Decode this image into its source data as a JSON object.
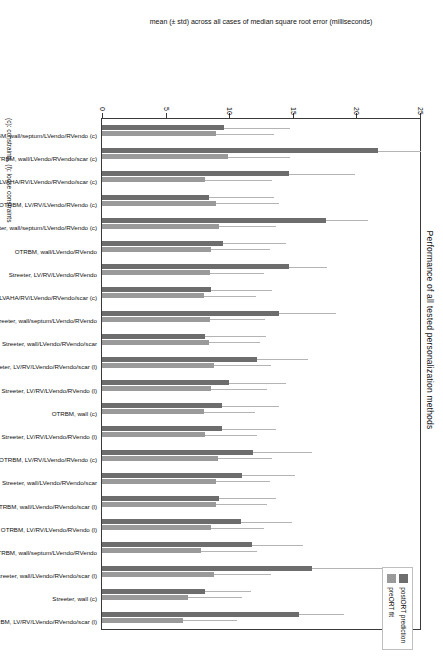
{
  "chart_data": {
    "type": "bar",
    "orientation": "vertical-rotated",
    "title": "Performance of all tested personalization methods",
    "xlabel": "",
    "ylabel": "mean (± std) across all cases of median square root error (milliseconds)",
    "ylim": [
      0,
      25
    ],
    "yticks": [
      0,
      5,
      10,
      15,
      20,
      25
    ],
    "grid": false,
    "legend_position": "top-right",
    "footnote": "(c): constraints, (l): loose constraints",
    "categories": [
      "OTRBM, wall/septum/LVendo/RVendo (c)",
      "OTRBM, wall/LVendo/RVendo/scar (c)",
      "OTRBM, LVAHA/RV/LVendo/RVendo/scar (c)",
      "OTRBM, LV/RV/LVendo/RVendo (c)",
      "Streeter, wall/septum/LVendo/RVendo (c)",
      "OTRBM, wall/LVendo/RVendo",
      "Streeter, LV/RV/LVendo/RVendo",
      "Streeter, LVAHA/RV/LVendo/RVendo/scar (c)",
      "Streeter, wall/septum/LVendo/RVendo",
      "Streeter, wall/LVendo/RVendo/scar",
      "Streeter, LV/RV/LVendo/RVendo/scar (l)",
      "Streeter, LV/RV/LVendo/RVendo (l)",
      "OTRBM, wall (c)",
      "Streeter, LV/RV/LVendo/RVendo (l)",
      "OTRBM, LV/RV/LVendo/RVendo (c)",
      "Streeter, wall/LVendo/RVendo/scar",
      "OTRBM, wall/LVendo/RVendo/scar (l)",
      "OTRBM, LV/RV/LVendo/RVendo (l)",
      "OTRBM, wall/septum/LVendo/RVendo",
      "Streeter, wall/LVendo/RVendo/scar (l)",
      "Streeter, wall (c)",
      "OTRBM, LV/RV/LVendo/RVendo/scar (l)"
    ],
    "series": [
      {
        "name": "postORT prediction",
        "color": "#6d6d6d",
        "values": [
          9.6,
          21.7,
          14.7,
          8.4,
          17.6,
          9.5,
          14.7,
          8.6,
          13.9,
          8.1,
          12.2,
          10.0,
          9.4,
          9.4,
          11.9,
          11.0,
          9.2,
          10.9,
          11.8,
          16.5,
          8.1,
          15.5
        ],
        "errors": [
          5.2,
          3.4,
          5.2,
          5.1,
          3.3,
          5.0,
          3.0,
          4.8,
          4.5,
          4.8,
          4.0,
          4.5,
          4.5,
          4.3,
          4.6,
          4.2,
          4.5,
          4.0,
          4.0,
          6.6,
          3.6,
          3.5
        ]
      },
      {
        "name": "preORT fit",
        "color": "#9a9a9a",
        "values": [
          9.0,
          9.9,
          8.1,
          9.0,
          9.2,
          8.6,
          8.5,
          8.0,
          8.5,
          8.4,
          8.8,
          8.6,
          8.0,
          8.1,
          9.1,
          9.0,
          9.0,
          8.6,
          7.8,
          8.8,
          6.8,
          6.4
        ],
        "errors": [
          4.5,
          4.9,
          5.3,
          4.9,
          4.5,
          4.6,
          4.2,
          4.1,
          4.3,
          4.0,
          4.5,
          4.4,
          4.0,
          4.1,
          4.3,
          4.2,
          4.0,
          4.1,
          4.4,
          4.5,
          4.2,
          4.2
        ]
      }
    ]
  },
  "legend": {
    "items": [
      {
        "label": "postORT prediction",
        "color": "#6d6d6d"
      },
      {
        "label": "preORT fit",
        "color": "#9a9a9a"
      }
    ]
  }
}
